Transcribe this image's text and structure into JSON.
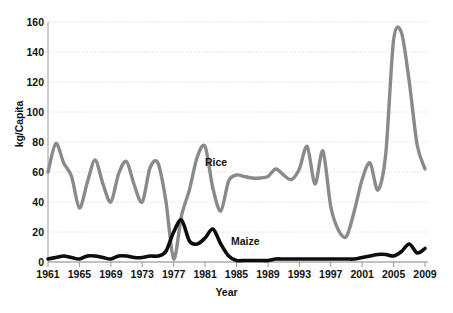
{
  "chart_data": {
    "type": "line",
    "title": "",
    "xlabel": "Year",
    "ylabel": "kg/Capita",
    "xlim": [
      1961,
      2009
    ],
    "ylim": [
      0,
      160
    ],
    "y_ticks": [
      0,
      20,
      40,
      60,
      80,
      100,
      120,
      140,
      160
    ],
    "x_ticks": [
      1961,
      1965,
      1969,
      1973,
      1977,
      1981,
      1985,
      1989,
      1993,
      1997,
      2001,
      2005,
      2009
    ],
    "grid": true,
    "grid_style": "dotted-horizontal",
    "legend_position": "inline-annotation",
    "x": [
      1961,
      1962,
      1963,
      1964,
      1965,
      1966,
      1967,
      1968,
      1969,
      1970,
      1971,
      1972,
      1973,
      1974,
      1975,
      1976,
      1977,
      1978,
      1979,
      1980,
      1981,
      1982,
      1983,
      1984,
      1985,
      1986,
      1987,
      1988,
      1989,
      1990,
      1991,
      1992,
      1993,
      1994,
      1995,
      1996,
      1997,
      1998,
      1999,
      2000,
      2001,
      2002,
      2003,
      2004,
      2005,
      2006,
      2007,
      2008,
      2009
    ],
    "series": [
      {
        "name": "Rice",
        "color": "#8a8a8a",
        "values": [
          60,
          79,
          66,
          57,
          36,
          53,
          68,
          52,
          40,
          59,
          67,
          51,
          40,
          63,
          66,
          41,
          2,
          31,
          48,
          70,
          77,
          49,
          34,
          54,
          58,
          57,
          56,
          56,
          57,
          62,
          58,
          55,
          62,
          77,
          52,
          74,
          37,
          21,
          17,
          34,
          55,
          66,
          48,
          72,
          148,
          153,
          120,
          78,
          62
        ]
      },
      {
        "name": "Maize",
        "color": "#0d0d0d",
        "values": [
          2,
          3,
          4,
          3,
          2,
          4,
          4,
          3,
          2,
          4,
          4,
          3,
          3,
          4,
          4,
          7,
          20,
          28,
          14,
          12,
          16,
          22,
          12,
          4,
          1,
          1,
          1,
          1,
          1,
          2,
          2,
          2,
          2,
          2,
          2,
          2,
          2,
          2,
          2,
          2,
          3,
          4,
          5,
          5,
          4,
          7,
          12,
          6,
          9
        ]
      }
    ],
    "annotations": [
      {
        "name": "Rice",
        "label": "Rice"
      },
      {
        "name": "Maize",
        "label": "Maize"
      }
    ]
  },
  "axis": {
    "y_label": "kg/Capita",
    "x_label": "Year",
    "y_ticks": [
      "160",
      "140",
      "120",
      "100",
      "80",
      "60",
      "40",
      "20",
      "0"
    ],
    "x_ticks": [
      "1961",
      "1965",
      "1969",
      "1973",
      "1977",
      "1981",
      "1985",
      "1989",
      "1993",
      "1997",
      "2001",
      "2005",
      "2009"
    ]
  },
  "labels": {
    "rice": "Rice",
    "maize": "Maize"
  },
  "colors": {
    "rice_line": "#8a8a8a",
    "maize_line": "#0d0d0d",
    "grid": "#cfcfcf",
    "axis_line": "#9a9a9a",
    "text": "#111111",
    "background": "#ffffff"
  }
}
